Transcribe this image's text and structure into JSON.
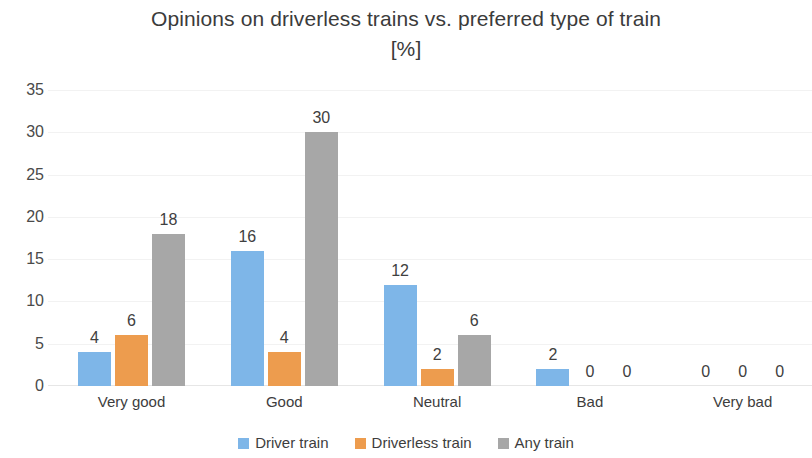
{
  "chart_data": {
    "type": "bar",
    "title": "Opinions on driverless trains vs. preferred type of train [%]",
    "title_line1": "Opinions on driverless trains vs. preferred type of train",
    "title_line2": "[%]",
    "xlabel": "",
    "ylabel": "",
    "ylim": [
      0,
      35
    ],
    "ytick_step": 5,
    "yticks": [
      "35",
      "30",
      "25",
      "20",
      "15",
      "10",
      "5",
      "0"
    ],
    "grid": true,
    "legend_position": "bottom",
    "categories": [
      "Very good",
      "Good",
      "Neutral",
      "Bad",
      "Very bad"
    ],
    "series": [
      {
        "name": "Driver train",
        "color": "#7EB6E8",
        "values": [
          4,
          16,
          12,
          2,
          0
        ]
      },
      {
        "name": "Driverless train",
        "color": "#ED9C4E",
        "values": [
          6,
          4,
          2,
          0,
          0
        ]
      },
      {
        "name": "Any train",
        "color": "#A7A7A7",
        "values": [
          18,
          30,
          6,
          0,
          0
        ]
      }
    ],
    "data_labels": [
      [
        "4",
        "6",
        "18"
      ],
      [
        "16",
        "4",
        "30"
      ],
      [
        "12",
        "2",
        "6"
      ],
      [
        "2",
        "0",
        "0"
      ],
      [
        "0",
        "0",
        "0"
      ]
    ]
  },
  "legend": {
    "items": [
      {
        "label": "Driver train",
        "color": "#7EB6E8",
        "swatch_name": "legend-swatch-driver-train"
      },
      {
        "label": "Driverless train",
        "color": "#ED9C4E",
        "swatch_name": "legend-swatch-driverless-train"
      },
      {
        "label": "Any train",
        "color": "#A7A7A7",
        "swatch_name": "legend-swatch-any-train"
      }
    ]
  }
}
